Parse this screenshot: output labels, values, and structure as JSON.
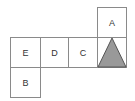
{
  "diagram": {
    "type": "cube-net",
    "faces": [
      {
        "label": "A",
        "row": 0,
        "col": 3
      },
      {
        "label": "E",
        "row": 1,
        "col": 0
      },
      {
        "label": "D",
        "row": 1,
        "col": 1
      },
      {
        "label": "C",
        "row": 1,
        "col": 2
      },
      {
        "label": "",
        "row": 1,
        "col": 3,
        "symbol": "triangle"
      },
      {
        "label": "B",
        "row": 2,
        "col": 0
      }
    ],
    "colors": {
      "line": "#8a8a8a",
      "triangle_fill": "#999999",
      "triangle_stroke": "#555555"
    }
  }
}
